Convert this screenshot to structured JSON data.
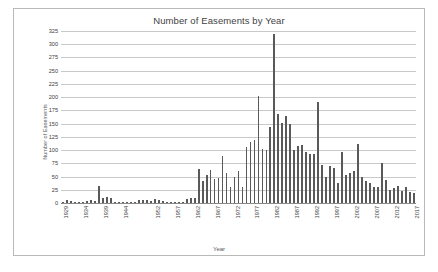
{
  "chart_data": {
    "type": "bar",
    "title": "Number of Easements by Year",
    "xlabel": "Year",
    "ylabel": "Number of Easements",
    "ylim": [
      0,
      325
    ],
    "ytick_step": 25,
    "yticks": [
      0,
      25,
      50,
      75,
      100,
      125,
      150,
      175,
      200,
      225,
      250,
      275,
      300,
      325
    ],
    "xtick_labels": [
      "1929",
      "1934",
      "1939",
      "1944",
      "1952",
      "1957",
      "1962",
      "1967",
      "1972",
      "1977",
      "1982",
      "1987",
      "1992",
      "1997",
      "2002",
      "2007",
      "2012",
      "2017"
    ],
    "xtick_years": [
      1929,
      1934,
      1939,
      1944,
      1952,
      1957,
      1962,
      1967,
      1972,
      1977,
      1982,
      1987,
      1992,
      1997,
      2002,
      2007,
      2012,
      2017
    ],
    "grid": true,
    "legend": false,
    "bar_color": "#595959",
    "gridline_color": "#c9c9c9",
    "categories": [
      1929,
      1930,
      1931,
      1932,
      1933,
      1934,
      1935,
      1936,
      1937,
      1938,
      1939,
      1940,
      1941,
      1942,
      1943,
      1944,
      1945,
      1946,
      1947,
      1948,
      1949,
      1950,
      1951,
      1952,
      1953,
      1954,
      1955,
      1956,
      1957,
      1958,
      1959,
      1960,
      1961,
      1962,
      1963,
      1964,
      1965,
      1966,
      1967,
      1968,
      1969,
      1970,
      1971,
      1972,
      1973,
      1974,
      1975,
      1976,
      1977,
      1978,
      1979,
      1980,
      1981,
      1982,
      1983,
      1984,
      1985,
      1986,
      1987,
      1988,
      1989,
      1990,
      1991,
      1992,
      1993,
      1994,
      1995,
      1996,
      1997,
      1998,
      1999,
      2000,
      2001,
      2002,
      2003,
      2004,
      2005,
      2006,
      2007,
      2008,
      2009,
      2010,
      2011,
      2012,
      2013,
      2014,
      2015,
      2016,
      2017
    ],
    "values": [
      2,
      5,
      4,
      1,
      1,
      1,
      3,
      5,
      4,
      33,
      10,
      11,
      10,
      2,
      1,
      1,
      1,
      2,
      1,
      5,
      6,
      6,
      4,
      7,
      5,
      3,
      1,
      1,
      1,
      1,
      2,
      8,
      9,
      10,
      64,
      42,
      52,
      62,
      45,
      47,
      88,
      56,
      30,
      50,
      60,
      31,
      106,
      116,
      119,
      202,
      102,
      100,
      143,
      320,
      169,
      151,
      164,
      149,
      101,
      107,
      110,
      96,
      92,
      93,
      191,
      71,
      50,
      69,
      67,
      38,
      97,
      52,
      56,
      61,
      112,
      49,
      41,
      38,
      31,
      30,
      76,
      43,
      24,
      29,
      32,
      22,
      30,
      20,
      18
    ]
  }
}
